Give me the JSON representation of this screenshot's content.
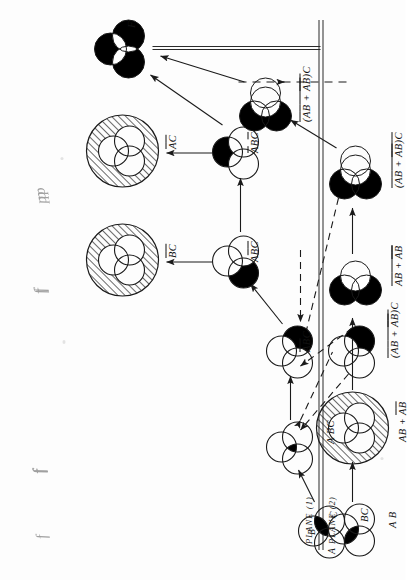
{
  "figure": {
    "orientation_deg": -90,
    "plane_labels": {
      "plane1": "PLANE (1)",
      "plane2": "PLANE (2)"
    },
    "output_label": "F",
    "dynamics": [
      {
        "id": "f",
        "text": "f"
      },
      {
        "id": "fff",
        "text": "fff"
      },
      {
        "id": "ff",
        "text": "ff"
      },
      {
        "id": "ppp",
        "text": "ppp"
      }
    ],
    "set_letters": {
      "a": "A",
      "b": "B",
      "c": "C"
    },
    "colors": {
      "ink": "#121212",
      "fill": "#000000",
      "outline": "#1a1a1a",
      "hatch": "#111111",
      "paper": "#fdfdfd"
    }
  },
  "nodes": [
    {
      "id": "bc-source",
      "label": "BC",
      "label_parts": [
        {
          "t": "B",
          "bar": false
        },
        {
          "t": "C",
          "bar": false
        }
      ],
      "kind": "venn3",
      "fill_regions": [
        "BC"
      ],
      "shows_letters": true,
      "x": 52,
      "y": 322
    },
    {
      "id": "abc",
      "label": "A BC",
      "label_parts": [
        {
          "t": "A",
          "bar": false
        },
        {
          "t": "BC",
          "bar": false
        }
      ],
      "kind": "venn3",
      "fill_regions": [
        "ABC"
      ],
      "shows_letters": false,
      "x": 132,
      "y": 290
    },
    {
      "id": "abarbbarc",
      "label": "A B C",
      "label_parts": [
        {
          "t": "A",
          "bar": true
        },
        {
          "t": "B",
          "bar": true
        },
        {
          "t": "C",
          "bar": false
        }
      ],
      "kind": "venn3",
      "fill_regions": [
        "notA-notB-C"
      ],
      "shows_letters": false,
      "x": 228,
      "y": 290
    },
    {
      "id": "abarcbar",
      "label": "A B C",
      "label_parts": [
        {
          "t": "A",
          "bar": false
        },
        {
          "t": "B",
          "bar": true
        },
        {
          "t": "C",
          "bar": true
        }
      ],
      "kind": "venn3",
      "fill_regions": [
        "A-notB-notC"
      ],
      "shows_letters": false,
      "x": 318,
      "y": 236
    },
    {
      "id": "bbarcbar",
      "label": "B C",
      "label_parts": [
        {
          "t": "B",
          "bar": true
        },
        {
          "t": "C",
          "bar": true
        }
      ],
      "kind": "venn3-hatched",
      "fill_regions": [
        "outside"
      ],
      "shows_letters": false,
      "x": 318,
      "y": 120
    },
    {
      "id": "abarbcbar",
      "label": "A B C",
      "label_parts": [
        {
          "t": "A",
          "bar": true
        },
        {
          "t": "B",
          "bar": false
        },
        {
          "t": "C",
          "bar": true
        }
      ],
      "kind": "venn3",
      "fill_regions": [
        "notA-B-notC"
      ],
      "shows_letters": false,
      "x": 427,
      "y": 236
    },
    {
      "id": "abarcbar2",
      "label": "A C",
      "label_parts": [
        {
          "t": "A",
          "bar": true
        },
        {
          "t": "C",
          "bar": true
        }
      ],
      "kind": "venn3-hatched",
      "fill_regions": [
        "outside"
      ],
      "shows_letters": false,
      "x": 427,
      "y": 120
    },
    {
      "id": "output-f",
      "label": "F",
      "label_parts": [
        {
          "t": "F",
          "bar": false
        }
      ],
      "kind": "venn3-tri-fill",
      "fill_regions": [
        "three-lobes"
      ],
      "shows_letters": false,
      "x": 528,
      "y": 122
    },
    {
      "id": "ab",
      "label": "A B",
      "label_parts": [
        {
          "t": "A",
          "bar": false
        },
        {
          "t": "B",
          "bar": false
        }
      ],
      "kind": "venn3",
      "fill_regions": [
        "AB"
      ],
      "shows_letters": false,
      "x": 52,
      "y": 352
    },
    {
      "id": "ab-plus-abarbbar",
      "label": "A B + A B",
      "label_parts": [
        {
          "t": "A B",
          "bar": false
        },
        {
          "t": "+",
          "bar": false
        },
        {
          "t": "A B",
          "bar": true
        }
      ],
      "kind": "venn3-hatched",
      "fill_regions": [
        "outside"
      ],
      "shows_letters": false,
      "x": 152,
      "y": 352
    },
    {
      "id": "ab-plus-abarbbar-bar",
      "label": "A B + A B",
      "label_parts": [
        {
          "t": "A B + A B",
          "bar": "full"
        }
      ],
      "kind": "venn2-double",
      "fill_regions": [
        "two-lobes"
      ],
      "shows_letters": false,
      "x": 296,
      "y": 352
    },
    {
      "id": "ab-abarbbar-c-bar",
      "label": "(A B + A B) C",
      "label_parts": [
        {
          "t": "(A B + A B)",
          "bar": "full"
        },
        {
          "t": "C",
          "bar": false
        }
      ],
      "kind": "venn3-two-fill",
      "fill_regions": [
        "two-lobes"
      ],
      "shows_letters": false,
      "x": 402,
      "y": 352
    },
    {
      "id": "ab-abarbbar-c",
      "label": "(A B + A B) C",
      "label_parts": [
        {
          "t": "(A B + A B)",
          "bar": "partial"
        },
        {
          "t": "C",
          "bar": false
        }
      ],
      "kind": "venn3-two-fill",
      "fill_regions": [
        "two-lobes"
      ],
      "shows_letters": false,
      "x": 470,
      "y": 262
    },
    {
      "id": "abbarc-mid",
      "label": "(A B + A B) C",
      "label_parts": [
        {
          "t": "(A B + A B)",
          "bar": "partial"
        },
        {
          "t": "C",
          "bar": false
        }
      ],
      "kind": "venn3",
      "fill_regions": [
        "notA-notB-C"
      ],
      "shows_letters": false,
      "x": 228,
      "y": 352
    }
  ],
  "edges": {
    "solid_count": 10,
    "dashed_count": 6
  }
}
